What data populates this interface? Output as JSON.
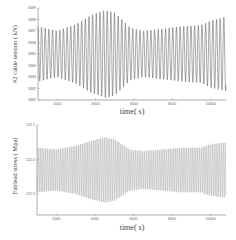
{
  "chart_data": [
    {
      "type": "line",
      "title": "",
      "xlabel": "time( s)",
      "ylabel": "#2 cable tension ( kN)",
      "xlim": [
        1000,
        10800
      ],
      "ylim": [
        3481,
        3489
      ],
      "xticks": [
        2000,
        4000,
        6000,
        8000,
        10000
      ],
      "xtick_labels": [
        "2000",
        "4000",
        "6000",
        "8000",
        "10000"
      ],
      "yticks": [
        3489,
        3488,
        3487,
        3486,
        3485,
        3484,
        3483,
        3482,
        3481
      ],
      "ytick_labels": [
        "3489",
        "3488",
        "3487",
        "3486",
        "3485",
        "3484",
        "3483",
        "3482",
        "3481"
      ],
      "grid": false,
      "legend": null,
      "line_color": "#555555",
      "series": [
        {
          "name": "#2 cable tension",
          "mean": 3485.0,
          "period_s": 190,
          "envelope": {
            "x": [
              1000,
              2000,
              3000,
              3800,
              4500,
              5000,
              5800,
              6500,
              7500,
              8500,
              9500,
              10000,
              10700
            ],
            "amplitude": [
              2.4,
              2.0,
              2.6,
              3.4,
              3.8,
              3.6,
              2.3,
              2.0,
              2.2,
              2.4,
              2.5,
              2.9,
              3.2
            ]
          }
        }
      ]
    },
    {
      "type": "line",
      "title": "",
      "xlabel": "time( s)",
      "ylabel": "Fairlead stress ( Mpa)",
      "xlim": [
        1000,
        10800
      ],
      "ylim": [
        121.84,
        122.1
      ],
      "xticks": [
        2000,
        4000,
        6000,
        8000,
        10000
      ],
      "xtick_labels": [
        "2000",
        "4000",
        "6000",
        "8000",
        "10000"
      ],
      "yticks": [
        122.1,
        122.0,
        121.9
      ],
      "ytick_labels": [
        "122.1",
        "122.0",
        "121.9"
      ],
      "grid": false,
      "legend": null,
      "line_color": "#aaaaaa",
      "series": [
        {
          "name": "Fairlead stress",
          "mean": 121.97,
          "period_s": 95,
          "envelope": {
            "x": [
              1000,
              2000,
              3000,
              3800,
              4500,
              5000,
              5800,
              6500,
              7500,
              8500,
              9500,
              10000,
              10700
            ],
            "amplitude": [
              0.065,
              0.06,
              0.07,
              0.085,
              0.095,
              0.09,
              0.06,
              0.055,
              0.06,
              0.065,
              0.065,
              0.075,
              0.08
            ]
          }
        }
      ]
    }
  ]
}
